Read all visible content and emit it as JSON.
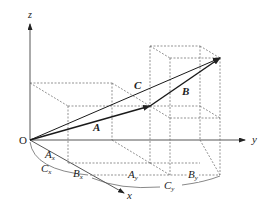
{
  "diagram": {
    "type": "3d-vector-addition",
    "axes": {
      "x": "x",
      "y": "y",
      "z": "z",
      "origin": "O"
    },
    "vectors": [
      {
        "name": "A",
        "from": "O",
        "to": "tip of A"
      },
      {
        "name": "B",
        "from": "tip of A",
        "to": "tip of C"
      },
      {
        "name": "C",
        "from": "O",
        "to": "tip of C"
      }
    ],
    "components": {
      "Ax": "A",
      "Ax_sub": "x",
      "Bx": "B",
      "Bx_sub": "x",
      "Cx": "C",
      "Cx_sub": "x",
      "Ay": "A",
      "Ay_sub": "y",
      "By": "B",
      "By_sub": "y",
      "Cy": "C",
      "Cy_sub": "y"
    },
    "colors": {
      "line": "#333333",
      "dashed": "#666666",
      "vector": "#1a1a1a"
    }
  }
}
